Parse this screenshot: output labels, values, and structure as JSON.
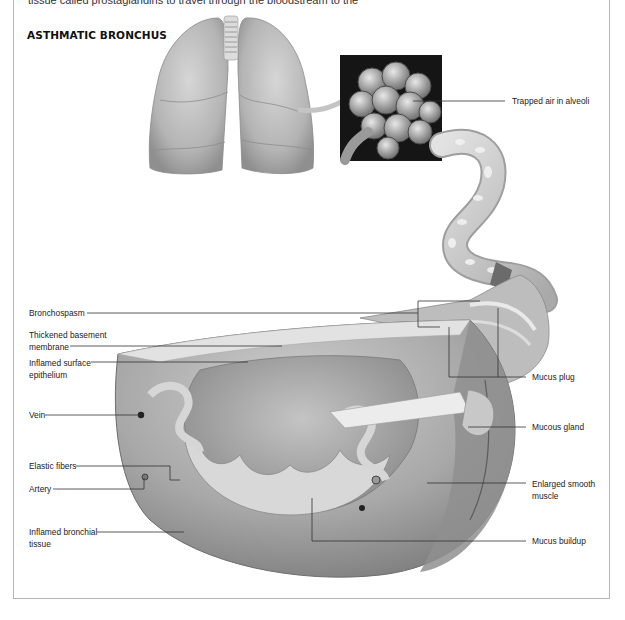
{
  "intro": {
    "text": "tissue called prostaglandins to travel through the bloodstream to the"
  },
  "figure": {
    "title": "ASTHMATIC BRONCHUS",
    "labels_left": [
      {
        "id": "bronchospasm",
        "text": "Bronchospasm"
      },
      {
        "id": "thickened-basement-membrane",
        "line1": "Thickened basement",
        "line2": "membrane"
      },
      {
        "id": "inflamed-surface-epithelium",
        "line1": "Inflamed surface",
        "line2": "epithelium"
      },
      {
        "id": "vein",
        "text": "Vein"
      },
      {
        "id": "elastic-fibers",
        "text": "Elastic fibers"
      },
      {
        "id": "artery",
        "text": "Artery"
      },
      {
        "id": "inflamed-bronchial-tissue",
        "line1": "Inflamed bronchial",
        "line2": "tissue"
      }
    ],
    "labels_right": [
      {
        "id": "trapped-air-in-alveoli",
        "text": "Trapped air in alveoli"
      },
      {
        "id": "mucus-plug",
        "text": "Mucus plug"
      },
      {
        "id": "mucous-gland",
        "text": "Mucous gland"
      },
      {
        "id": "enlarged-smooth-muscle",
        "line1": "Enlarged smooth",
        "line2": "muscle"
      },
      {
        "id": "mucus-buildup",
        "text": "Mucus buildup"
      }
    ],
    "illustrations": [
      "lungs",
      "alveoli-inset",
      "bronchus-tube",
      "bronchus-cross-section"
    ],
    "colors": {
      "line": "#333333",
      "frame": "#b5b5b5",
      "tissue": "#b8b8b8",
      "tissue_dark": "#7a7a7a",
      "inset_bg": "#151515"
    }
  }
}
